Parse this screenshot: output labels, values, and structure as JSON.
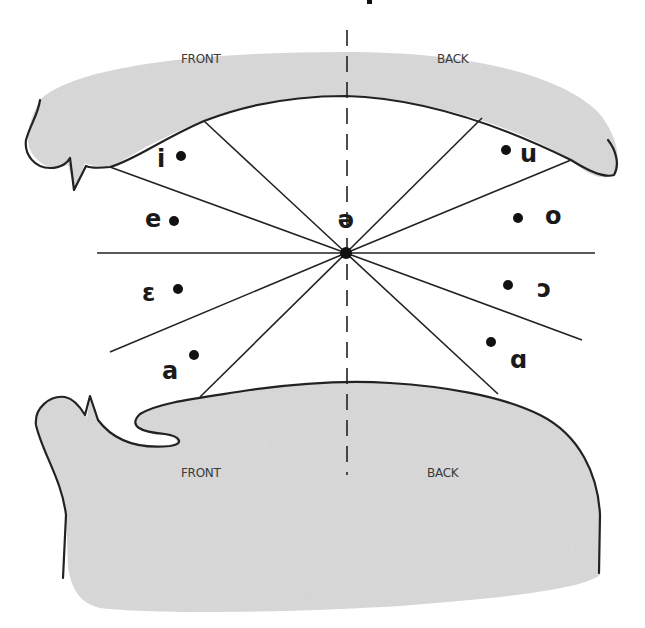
{
  "diagram": {
    "title_fragment": "",
    "upper_labels": {
      "front": "FRONT",
      "back": "BACK"
    },
    "lower_labels": {
      "front": "FRONT",
      "back": "BACK"
    },
    "center_vowel": {
      "symbol": "ə",
      "x": 346,
      "y": 253
    },
    "vowels": [
      {
        "symbol": "i",
        "label_x": 162,
        "label_y": 167,
        "dot_x": 181,
        "dot_y": 156,
        "region": "front"
      },
      {
        "symbol": "e",
        "label_x": 152,
        "label_y": 227,
        "dot_x": 174,
        "dot_y": 221,
        "region": "front"
      },
      {
        "symbol": "ɛ",
        "label_x": 148,
        "label_y": 301,
        "dot_x": 178,
        "dot_y": 289,
        "region": "front"
      },
      {
        "symbol": "a",
        "label_x": 170,
        "label_y": 379,
        "dot_x": 194,
        "dot_y": 355,
        "region": "front"
      },
      {
        "symbol": "u",
        "label_x": 520,
        "label_y": 162,
        "dot_x": 506,
        "dot_y": 150,
        "region": "back"
      },
      {
        "symbol": "o",
        "label_x": 542,
        "label_y": 224,
        "dot_x": 518,
        "dot_y": 218,
        "region": "back"
      },
      {
        "symbol": "ɔ",
        "label_x": 543,
        "label_y": 297,
        "dot_x": 508,
        "dot_y": 285,
        "region": "back"
      },
      {
        "symbol": "ɑ",
        "label_x": 519,
        "label_y": 368,
        "dot_x": 491,
        "dot_y": 342,
        "region": "back"
      }
    ],
    "colors": {
      "tissue_fill": "#d9d9d9",
      "outline": "#222222",
      "background": "#ffffff",
      "text": "#1a1a1a"
    }
  }
}
